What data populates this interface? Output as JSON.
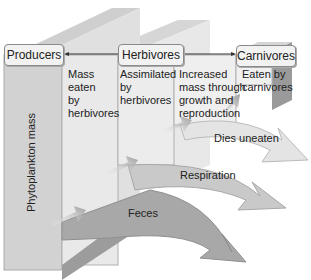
{
  "diagram": {
    "type": "energy-flow-3d",
    "nodes": [
      {
        "id": "producers",
        "label": "Producers"
      },
      {
        "id": "herbivores",
        "label": "Herbivores"
      },
      {
        "id": "carnivores",
        "label": "Carnivores"
      }
    ],
    "column_labels": [
      {
        "text": "Mass eaten by herbivores",
        "lines": [
          "Mass",
          "eaten",
          "by",
          "herbivores"
        ]
      },
      {
        "text": "Assimilated by herbivores",
        "lines": [
          "Assimilated",
          "by",
          "herbivores"
        ]
      },
      {
        "text": "Increased mass through growth and reproduction",
        "lines": [
          "Increased",
          "mass through",
          "growth and",
          "reproduction"
        ]
      },
      {
        "text": "Eaten by carnivores",
        "lines": [
          "Eaten by",
          "carnivores"
        ]
      }
    ],
    "axis_label": "Phytoplankton mass",
    "outflows": [
      {
        "label": "Dies uneaten"
      },
      {
        "label": "Respiration"
      },
      {
        "label": "Feces"
      }
    ],
    "colors": {
      "wall_light": "#e6e6e6",
      "wall_mid": "#c8c8c8",
      "wall_dark": "#a6a6a6",
      "arrow_light": "#e2e2e2",
      "arrow_mid": "#bdbdbd",
      "arrow_dark": "#9a9a9a"
    }
  }
}
